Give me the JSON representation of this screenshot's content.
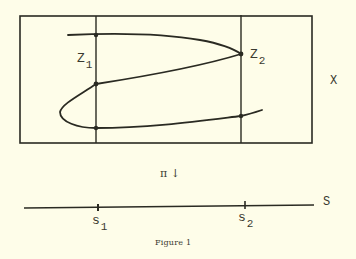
{
  "figure": {
    "caption": "Figure 1",
    "space_label": "X",
    "base_label": "S",
    "map_label": "π ↓",
    "points_in_X": [
      {
        "name": "z",
        "sub": "1"
      },
      {
        "name": "z",
        "sub": "2"
      }
    ],
    "points_in_S": [
      {
        "name": "s",
        "sub": "1"
      },
      {
        "name": "s",
        "sub": "2"
      }
    ],
    "colors": {
      "background": "#fefde9",
      "ink": "#2a2a22"
    }
  }
}
